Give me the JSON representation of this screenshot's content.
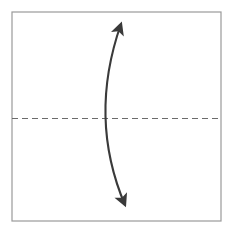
{
  "figure": {
    "title": "",
    "caption": "",
    "canvas": {
      "width": 233,
      "height": 228,
      "background": "#ffffff"
    }
  },
  "chart_data": {
    "type": "diagram",
    "title": "",
    "xlabel": "",
    "ylabel": "",
    "xlim": [
      0,
      233
    ],
    "ylim": [
      0,
      228
    ],
    "grid": false,
    "legend": null,
    "elements": [
      {
        "name": "panel-frame",
        "kind": "rectangle",
        "x": 12,
        "y": 12,
        "width": 209,
        "height": 209,
        "stroke": "#9a9a9a",
        "stroke_width": 1.2,
        "fill": "#ffffff"
      },
      {
        "name": "fold-axis",
        "kind": "dashed-line",
        "x1": 12,
        "y1": 118.5,
        "x2": 221,
        "y2": 118.5,
        "stroke": "#6b6b6b",
        "stroke_width": 1.2,
        "dash": "6 4"
      },
      {
        "name": "double-headed-curved-arrow",
        "kind": "arc-arrow",
        "start": [
          121,
          24
        ],
        "control": [
          88,
          118
        ],
        "end": [
          125,
          205
        ],
        "stroke": "#3a3a3a",
        "stroke_width": 2.1,
        "arrowheads": "both",
        "arrowhead_fill": "#3a3a3a",
        "bow_direction": "left"
      }
    ]
  },
  "colors": {
    "frame_stroke": "#9a9a9a",
    "axis_stroke": "#6b6b6b",
    "arrow_stroke": "#3a3a3a",
    "background": "#ffffff"
  }
}
